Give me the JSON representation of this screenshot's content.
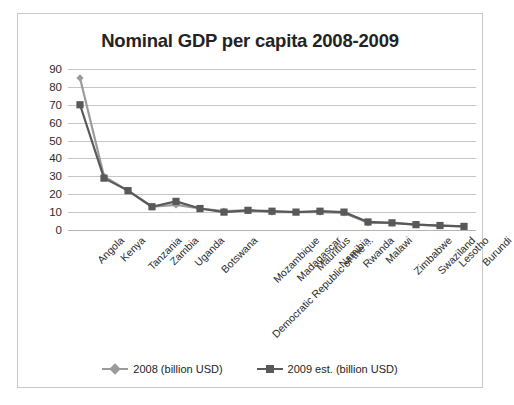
{
  "chart_data": {
    "type": "line",
    "title": "Nominal GDP per capita 2008-2009",
    "xlabel": "",
    "ylabel": "",
    "ylim": [
      0,
      90
    ],
    "ytick_step": 10,
    "yticks": [
      "90",
      "80",
      "70",
      "60",
      "50",
      "40",
      "30",
      "20",
      "10",
      "0"
    ],
    "grid": true,
    "legend_position": "bottom",
    "categories": [
      "Angola",
      "Kenya",
      "Tanzania",
      "Zambia",
      "Uganda",
      "Botswana",
      "Democratic Republic of the ...",
      "Mozambique",
      "Madagascar",
      "Mauritius",
      "Namibia",
      "Rwanda",
      "Malawi",
      "Zimbabwe",
      "Swaziland",
      "Lesotho",
      "Burundi"
    ],
    "series": [
      {
        "name": "2008 (billion USD)",
        "marker": "diamond",
        "color": "#9b9b9b",
        "values": [
          85,
          30,
          22,
          13,
          14,
          12,
          10.5,
          11,
          10,
          10,
          10,
          9.5,
          4,
          4,
          3,
          2.5,
          2
        ]
      },
      {
        "name": "2009 est. (billion USD)",
        "marker": "square",
        "color": "#595959",
        "values": [
          70,
          29,
          22,
          13,
          16,
          12,
          10,
          11,
          10.5,
          10,
          10.5,
          10,
          4.5,
          4,
          3,
          2.5,
          2
        ]
      }
    ]
  },
  "legend": {
    "entries": [
      {
        "label": "2008 (billion USD)"
      },
      {
        "label": "2009 est. (billion USD)"
      }
    ]
  },
  "colors": {
    "series_2008": "#9b9b9b",
    "series_2009": "#595959",
    "gridline": "#c6c6c6",
    "border": "#c9c9c9",
    "text": "#232323"
  }
}
